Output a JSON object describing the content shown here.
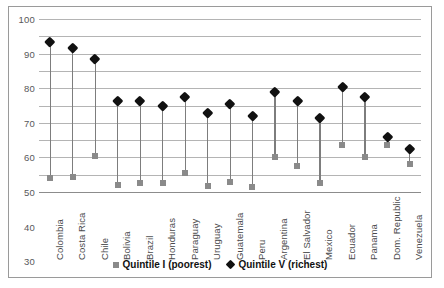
{
  "chart_data": {
    "type": "scatter",
    "title": "",
    "xlabel": "",
    "ylabel": "",
    "ylim": [
      0,
      100
    ],
    "ytick_step": 10,
    "yticks": [
      "100",
      "90",
      "80",
      "70",
      "60",
      "50",
      "40",
      "30",
      "20",
      "10",
      "0"
    ],
    "grid": true,
    "legend_position": "bottom",
    "categories": [
      "Colombia",
      "Costa Rica",
      "Chile",
      "Bolivia",
      "Brazil",
      "Honduras",
      "Paraguay",
      "Uruguay",
      "Guatemala",
      "Peru",
      "Argentina",
      "El Salvador",
      "Mexico",
      "Ecuador",
      "Panama",
      "Dom. Republic",
      "Venezuela"
    ],
    "series": [
      {
        "name": "Quintile I (poorest)",
        "marker": "square",
        "color": "#8a8a8a",
        "values": [
          8,
          8.5,
          21,
          4,
          5,
          5,
          11,
          3.5,
          5.5,
          3,
          20,
          15,
          5,
          27,
          20,
          27,
          16
        ]
      },
      {
        "name": "Quintile V (richest)",
        "marker": "diamond",
        "color": "#111111",
        "values": [
          87,
          83.5,
          77,
          53,
          53,
          50,
          55,
          46,
          51,
          44,
          58,
          53,
          43,
          61,
          55,
          32,
          25
        ]
      }
    ]
  },
  "legend": {
    "items": [
      {
        "label": "Quintile I (poorest)",
        "marker": "square-marker"
      },
      {
        "label": "Quintile V (richest)",
        "marker": "diamond-marker"
      }
    ]
  },
  "colors": {
    "quintile_i": "#8a8a8a",
    "quintile_v": "#111111",
    "gridline": "#b4b4b4",
    "border": "#9a9a9a",
    "stem": "#7d7d7d",
    "axis_text": "#58585a"
  }
}
